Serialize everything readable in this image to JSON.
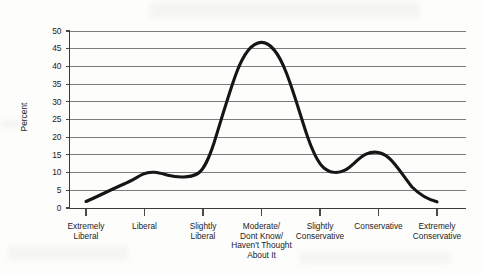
{
  "chart_data": {
    "type": "line",
    "title": "",
    "xlabel": "",
    "ylabel": "Percent",
    "ylim": [
      0,
      50
    ],
    "ytick_values": [
      0,
      5,
      10,
      15,
      20,
      25,
      30,
      35,
      40,
      45,
      50
    ],
    "ytick_labels": [
      "0",
      "5",
      "10",
      "15",
      "20",
      "25",
      "30",
      "35",
      "40",
      "45",
      "50"
    ],
    "grid": true,
    "grid_axis": "y",
    "legend": false,
    "legend_position": "none",
    "line_color": "#151515",
    "grid_color": "#6f6f6f",
    "axis_color": "#3a3a3a",
    "background_color": "#fdfdfc",
    "categories": [
      "Extremely Liberal",
      "Liberal",
      "Slightly Liberal",
      "Moderate/ Dont Know/ Haven't Thought About It",
      "Slightly Conservative",
      "Conservative",
      "Extremely Conservative"
    ],
    "category_lines": [
      [
        "Extremely",
        "Liberal"
      ],
      [
        "Liberal"
      ],
      [
        "Slightly",
        "Liberal"
      ],
      [
        "Moderate/",
        "Dont Know/",
        "Haven't Thought",
        "About It"
      ],
      [
        "Slightly",
        "Conservative"
      ],
      [
        "Conservative"
      ],
      [
        "Extremely",
        "Conservative"
      ]
    ],
    "values": [
      2,
      9.5,
      9.5,
      46,
      11,
      15.3,
      2
    ],
    "series": [
      {
        "name": "Percent",
        "values": [
          2,
          9.5,
          9.5,
          46,
          11,
          15.3,
          2
        ]
      }
    ],
    "annotations": []
  }
}
